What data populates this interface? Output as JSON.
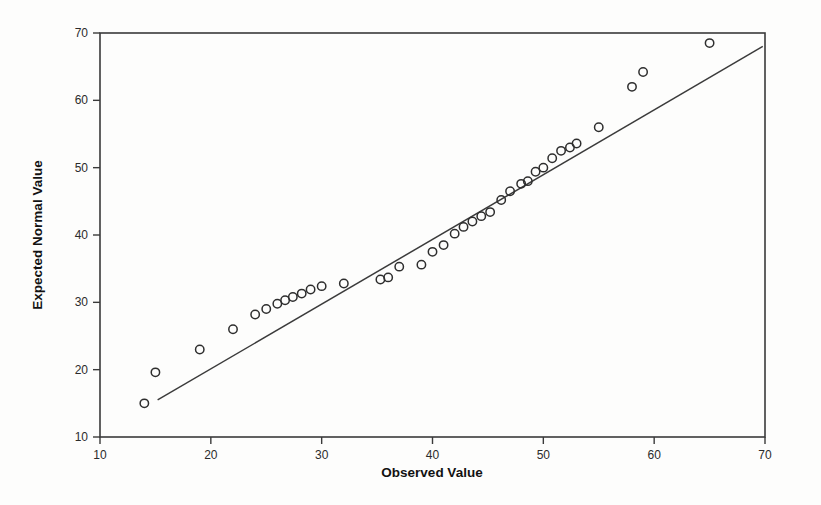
{
  "figure": {
    "background_color": "#fdfdfc",
    "frame_color": "#3a3a3a",
    "marker_color": "#2e2e2e",
    "line_color": "#3b3b3b"
  },
  "chart_data": {
    "type": "scatter",
    "title": "",
    "subtitle": "",
    "xlabel": "Observed Value",
    "ylabel": "Expected Normal Value",
    "xlim": [
      10,
      70
    ],
    "ylim": [
      10,
      70
    ],
    "xticks": [
      10,
      20,
      30,
      40,
      50,
      60,
      70
    ],
    "yticks": [
      10,
      20,
      30,
      40,
      50,
      60,
      70
    ],
    "xtick_labels": [
      "10",
      "20",
      "30",
      "40",
      "50",
      "60",
      "70"
    ],
    "ytick_labels": [
      "10",
      "20",
      "30",
      "40",
      "50",
      "60",
      "70"
    ],
    "grid": false,
    "legend": false,
    "legend_position": "none",
    "marker_style": "open-circle",
    "series": [
      {
        "name": "Expected Normal Value",
        "x": [
          14.0,
          15.0,
          19.0,
          22.0,
          24.0,
          25.0,
          26.0,
          26.7,
          27.4,
          28.2,
          29.0,
          30.0,
          32.0,
          35.3,
          36.0,
          37.0,
          39.0,
          40.0,
          41.0,
          42.0,
          42.8,
          43.6,
          44.4,
          45.2,
          46.2,
          47.0,
          48.0,
          48.6,
          49.3,
          50.0,
          50.8,
          51.6,
          52.4,
          53.0,
          55.0,
          58.0,
          59.0,
          65.0
        ],
        "y": [
          15.0,
          19.6,
          23.0,
          26.0,
          28.2,
          29.0,
          29.8,
          30.3,
          30.8,
          31.3,
          31.9,
          32.4,
          32.8,
          33.4,
          33.7,
          35.3,
          35.6,
          37.5,
          38.5,
          40.2,
          41.2,
          42.0,
          42.8,
          43.4,
          45.2,
          46.5,
          47.6,
          48.0,
          49.4,
          50.0,
          51.4,
          52.5,
          53.0,
          53.6,
          56.0,
          62.0,
          64.2,
          68.5
        ]
      }
    ],
    "reference_line": {
      "name": "normal reference line",
      "x": [
        15.2,
        69.8
      ],
      "y": [
        15.5,
        68.0
      ]
    }
  }
}
